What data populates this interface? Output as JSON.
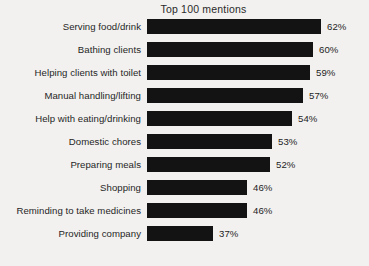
{
  "chart_data": {
    "type": "bar",
    "title": "Top 100 mentions",
    "xlabel": "",
    "ylabel": "",
    "orientation": "horizontal",
    "grid": false,
    "legend": "none",
    "xlim": [
      0,
      62
    ],
    "value_suffix": "%",
    "bar_color": "#131313",
    "background_color": "#f2f1ef",
    "text_color": "#262626",
    "categories": [
      "Serving food/drink",
      "Bathing clients",
      "Helping clients with toilet",
      "Manual handling/lifting",
      "Help with eating/drinking",
      "Domestic chores",
      "Preparing meals",
      "Shopping",
      "Reminding to take medicines",
      "Providing company"
    ],
    "values": [
      62,
      60,
      59,
      57,
      54,
      53,
      52,
      46,
      46,
      37
    ],
    "value_labels": [
      "62%",
      "60%",
      "59%",
      "57%",
      "54%",
      "53%",
      "52%",
      "46%",
      "46%",
      "37%"
    ],
    "bar_pixel_widths": [
      174,
      166,
      163,
      156,
      145,
      125,
      123,
      100,
      100,
      66
    ]
  }
}
